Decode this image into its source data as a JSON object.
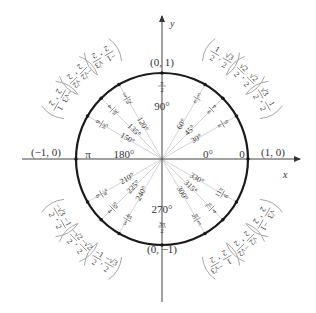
{
  "diagram": {
    "colors": {
      "circle": "#1a1a1a",
      "axis": "#444444",
      "ray": "#c8c8c8",
      "text": "#333333",
      "bracket": "#9a9a9a"
    },
    "center": {
      "x": 162,
      "y": 159
    },
    "radius": 86,
    "axes": {
      "x_label": "x",
      "y_label": "y",
      "x_range": [
        22,
        300
      ],
      "y_range": [
        16,
        302
      ]
    },
    "axis_points": [
      {
        "id": "right",
        "angle": 0,
        "degree": "0°",
        "radian": "0",
        "coord": "(1, 0)"
      },
      {
        "id": "top",
        "angle": 90,
        "degree": "90°",
        "radian": "π/2",
        "coord": "(0, 1)"
      },
      {
        "id": "left",
        "angle": 180,
        "degree": "180°",
        "radian": "π",
        "coord": "(−1, 0)"
      },
      {
        "id": "bottom",
        "angle": 270,
        "degree": "270°",
        "radian": "3π/2",
        "coord": "(0, −1)"
      }
    ],
    "angles": [
      {
        "angle": 30,
        "degree": "30°",
        "rad_num": "π",
        "rad_den": "6",
        "coord_x": "√3/2",
        "coord_y": "1/2"
      },
      {
        "angle": 45,
        "degree": "45°",
        "rad_num": "π",
        "rad_den": "4",
        "coord_x": "√2/2",
        "coord_y": "√2/2"
      },
      {
        "angle": 60,
        "degree": "60°",
        "rad_num": "π",
        "rad_den": "3",
        "coord_x": "1/2",
        "coord_y": "√3/2"
      },
      {
        "angle": 120,
        "degree": "120°",
        "rad_num": "2π",
        "rad_den": "3",
        "coord_x": "−1/2",
        "coord_y": "√3/2"
      },
      {
        "angle": 135,
        "degree": "135°",
        "rad_num": "3π",
        "rad_den": "4",
        "coord_x": "−√2/2",
        "coord_y": "√2/2"
      },
      {
        "angle": 150,
        "degree": "150°",
        "rad_num": "5π",
        "rad_den": "6",
        "coord_x": "−√3/2",
        "coord_y": "1/2"
      },
      {
        "angle": 210,
        "degree": "210°",
        "rad_num": "7π",
        "rad_den": "6",
        "coord_x": "−√3/2",
        "coord_y": "−1/2"
      },
      {
        "angle": 225,
        "degree": "225°",
        "rad_num": "5π",
        "rad_den": "4",
        "coord_x": "−√2/2",
        "coord_y": "−√2/2"
      },
      {
        "angle": 240,
        "degree": "240°",
        "rad_num": "4π",
        "rad_den": "3",
        "coord_x": "−1/2",
        "coord_y": "−√3/2"
      },
      {
        "angle": 300,
        "degree": "300°",
        "rad_num": "5π",
        "rad_den": "3",
        "coord_x": "1/2",
        "coord_y": "−√3/2"
      },
      {
        "angle": 315,
        "degree": "315°",
        "rad_num": "7π",
        "rad_den": "4",
        "coord_x": "√2/2",
        "coord_y": "−√2/2"
      },
      {
        "angle": 330,
        "degree": "330°",
        "rad_num": "11π",
        "rad_den": "6",
        "coord_x": "√3/2",
        "coord_y": "−1/2"
      }
    ]
  }
}
